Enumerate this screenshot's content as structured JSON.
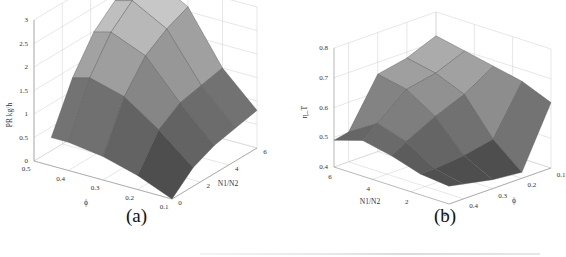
{
  "chart_data": [
    {
      "type": "surface3d",
      "panel": "(a)",
      "title": "",
      "xlabel": "N1/N2",
      "ylabel": "ϕ",
      "zlabel": "PR kg/h",
      "x_ticks": [
        "0",
        "2",
        "4",
        "6"
      ],
      "y_ticks": [
        "0.1",
        "0.2",
        "0.3",
        "0.4",
        "0.5"
      ],
      "z_ticks": [
        "0",
        "0.5",
        "1",
        "1.5",
        "2",
        "2.5",
        "3"
      ],
      "xlim": [
        0,
        6
      ],
      "ylim": [
        0.1,
        0.5
      ],
      "zlim": [
        0,
        3
      ],
      "grid": true,
      "x": [
        0,
        1.5,
        3,
        4.5,
        6
      ],
      "y": [
        0.1,
        0.2,
        0.3,
        0.4,
        0.45
      ],
      "z": [
        [
          0.0,
          0.4,
          0.6,
          0.7,
          0.8
        ],
        [
          0.3,
          1.0,
          1.3,
          1.4,
          1.5
        ],
        [
          0.5,
          1.5,
          2.1,
          2.4,
          2.6
        ],
        [
          0.6,
          1.7,
          2.4,
          2.8,
          3.0
        ],
        [
          0.6,
          1.6,
          2.3,
          2.7,
          2.9
        ]
      ],
      "colormap": "gray"
    },
    {
      "type": "surface3d",
      "panel": "(b)",
      "title": "",
      "xlabel": "N1/N2",
      "ylabel": "ϕ",
      "zlabel": "η_T",
      "x_ticks": [
        "0",
        "2",
        "4",
        "6"
      ],
      "y_ticks": [
        "0.1",
        "0.2",
        "0.3",
        "0.4"
      ],
      "z_ticks": [
        "0.4",
        "0.5",
        "0.6",
        "0.7",
        "0.8"
      ],
      "xlim": [
        0,
        6
      ],
      "ylim": [
        0.1,
        0.45
      ],
      "zlim": [
        0.4,
        0.8
      ],
      "grid": true,
      "x": [
        0,
        1.5,
        3,
        4.5,
        6
      ],
      "y": [
        0.1,
        0.2,
        0.3,
        0.4,
        0.45
      ],
      "z": [
        [
          0.62,
          0.66,
          0.68,
          0.7,
          0.72
        ],
        [
          0.42,
          0.5,
          0.62,
          0.66,
          0.68
        ],
        [
          0.43,
          0.48,
          0.58,
          0.64,
          0.66
        ],
        [
          0.45,
          0.47,
          0.53,
          0.56,
          0.5
        ],
        [
          0.46,
          0.47,
          0.5,
          0.52,
          0.49
        ]
      ],
      "colormap": "gray"
    }
  ],
  "panels": {
    "a": {
      "caption": "(a)"
    },
    "b": {
      "caption": "(b)"
    }
  }
}
